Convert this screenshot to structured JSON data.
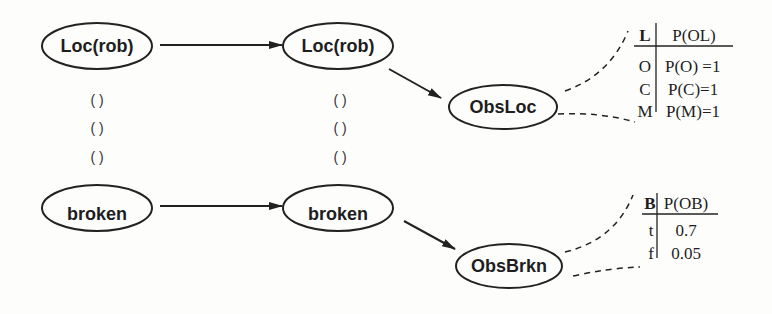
{
  "diagram": {
    "type": "dynamic-bayesian-network",
    "nodes": {
      "loc_t0": {
        "label": "Loc(rob)"
      },
      "loc_t1": {
        "label": "Loc(rob)"
      },
      "broken_t0": {
        "label": "broken"
      },
      "broken_t1": {
        "label": "broken"
      },
      "obs_loc": {
        "label": "ObsLoc"
      },
      "obs_brkn": {
        "label": "ObsBrkn"
      }
    },
    "ellipsis_glyph": "( )",
    "edges": [
      {
        "from": "loc_t0",
        "to": "loc_t1"
      },
      {
        "from": "broken_t0",
        "to": "broken_t1"
      },
      {
        "from": "loc_t1",
        "to": "obs_loc"
      },
      {
        "from": "broken_t1",
        "to": "obs_brkn"
      }
    ],
    "cpt_obsloc": {
      "header": {
        "var": "L",
        "prob": "P(OL)"
      },
      "rows": [
        {
          "var": "O",
          "prob": "P(O) =1"
        },
        {
          "var": "C",
          "prob": "P(C)=1"
        },
        {
          "var": "M",
          "prob": "P(M)=1"
        }
      ]
    },
    "cpt_obsbrkn": {
      "header": {
        "var": "B",
        "prob": "P(OB)"
      },
      "rows": [
        {
          "var": "t",
          "prob": "0.7"
        },
        {
          "var": "f",
          "prob": "0.05"
        }
      ]
    }
  }
}
